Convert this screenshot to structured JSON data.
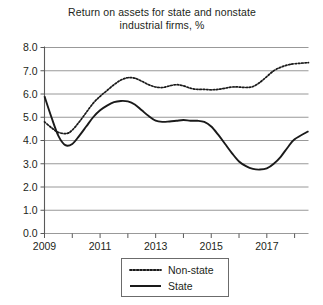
{
  "chart_data": {
    "type": "line",
    "title": "Return on assets for state and nonstate industrial firms, %",
    "title_line1": "Return on assets for state and nonstate",
    "title_line2": "industrial firms, %",
    "xlabel": "",
    "ylabel": "",
    "ylim": [
      0.0,
      8.0
    ],
    "xlim": [
      2009,
      2018.5
    ],
    "grid": true,
    "legend_position": "bottom-center",
    "ytick_labels": [
      "0.0",
      "1.0",
      "2.0",
      "3.0",
      "4.0",
      "5.0",
      "6.0",
      "7.0",
      "8.0"
    ],
    "ytick_values": [
      0.0,
      1.0,
      2.0,
      3.0,
      4.0,
      5.0,
      6.0,
      7.0,
      8.0
    ],
    "xtick_values": [
      2009,
      2010,
      2011,
      2012,
      2013,
      2014,
      2015,
      2016,
      2017,
      2018
    ],
    "xtick_labels": [
      "2009",
      "",
      "2011",
      "",
      "2013",
      "",
      "2015",
      "",
      "2017",
      ""
    ],
    "series": [
      {
        "name": "Non-state",
        "style": "dotted",
        "color": "#1a1a1a",
        "x": [
          2009.0,
          2009.25,
          2009.5,
          2009.8,
          2010.0,
          2010.25,
          2010.5,
          2010.75,
          2011.0,
          2011.25,
          2011.5,
          2011.75,
          2012.0,
          2012.25,
          2012.5,
          2012.75,
          2013.0,
          2013.25,
          2013.5,
          2013.75,
          2014.0,
          2014.25,
          2014.5,
          2014.75,
          2015.0,
          2015.25,
          2015.5,
          2015.75,
          2016.0,
          2016.25,
          2016.5,
          2016.75,
          2017.0,
          2017.25,
          2017.5,
          2017.75,
          2018.0,
          2018.5
        ],
        "values": [
          4.8,
          4.55,
          4.35,
          4.3,
          4.45,
          4.8,
          5.2,
          5.6,
          5.9,
          6.15,
          6.4,
          6.6,
          6.7,
          6.68,
          6.55,
          6.4,
          6.3,
          6.28,
          6.35,
          6.4,
          6.35,
          6.25,
          6.2,
          6.2,
          6.18,
          6.2,
          6.25,
          6.3,
          6.3,
          6.28,
          6.32,
          6.5,
          6.75,
          7.0,
          7.15,
          7.25,
          7.3,
          7.35
        ]
      },
      {
        "name": "State",
        "style": "solid",
        "color": "#1a1a1a",
        "x": [
          2009.0,
          2009.25,
          2009.5,
          2009.75,
          2010.0,
          2010.25,
          2010.5,
          2010.75,
          2011.0,
          2011.25,
          2011.5,
          2011.75,
          2012.0,
          2012.25,
          2012.5,
          2012.75,
          2013.0,
          2013.25,
          2013.5,
          2013.75,
          2014.0,
          2014.25,
          2014.5,
          2014.75,
          2015.0,
          2015.25,
          2015.5,
          2015.75,
          2016.0,
          2016.25,
          2016.5,
          2016.75,
          2017.0,
          2017.25,
          2017.5,
          2017.75,
          2018.0,
          2018.5
        ],
        "values": [
          5.9,
          5.0,
          4.2,
          3.8,
          3.85,
          4.2,
          4.6,
          5.0,
          5.3,
          5.5,
          5.65,
          5.7,
          5.68,
          5.55,
          5.3,
          5.05,
          4.85,
          4.8,
          4.82,
          4.85,
          4.88,
          4.85,
          4.85,
          4.8,
          4.6,
          4.25,
          3.85,
          3.45,
          3.1,
          2.9,
          2.78,
          2.75,
          2.8,
          3.0,
          3.3,
          3.7,
          4.05,
          4.4
        ]
      }
    ]
  },
  "legend": {
    "items": [
      {
        "label": "Non-state",
        "style": "dotted"
      },
      {
        "label": "State",
        "style": "solid"
      }
    ]
  }
}
